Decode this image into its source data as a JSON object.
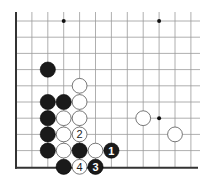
{
  "diagram": {
    "type": "go-board-fragment",
    "grid": {
      "cols": 12,
      "rows": 10,
      "origin_x": 16,
      "origin_y": 21,
      "spacing_x": 15.9,
      "spacing_y": 16.2,
      "left_edge": true,
      "bottom_edge": true,
      "line_color": "#9a9a9a",
      "edge_color": "#333333"
    },
    "star_points": [
      {
        "col": 3,
        "row": 0
      },
      {
        "col": 9,
        "row": 0
      },
      {
        "col": 9,
        "row": 6
      }
    ],
    "stones": [
      {
        "color": "black",
        "col": 2,
        "row": 3,
        "label": ""
      },
      {
        "color": "white",
        "col": 4,
        "row": 4,
        "label": ""
      },
      {
        "color": "black",
        "col": 2,
        "row": 5,
        "label": ""
      },
      {
        "color": "black",
        "col": 3,
        "row": 5,
        "label": ""
      },
      {
        "color": "white",
        "col": 4,
        "row": 5,
        "label": ""
      },
      {
        "color": "black",
        "col": 2,
        "row": 6,
        "label": ""
      },
      {
        "color": "white",
        "col": 3,
        "row": 6,
        "label": ""
      },
      {
        "color": "white",
        "col": 4,
        "row": 6,
        "label": ""
      },
      {
        "color": "black",
        "col": 2,
        "row": 7,
        "label": ""
      },
      {
        "color": "white",
        "col": 3,
        "row": 7,
        "label": ""
      },
      {
        "color": "white",
        "col": 4,
        "row": 7,
        "label": "2"
      },
      {
        "color": "black",
        "col": 2,
        "row": 8,
        "label": ""
      },
      {
        "color": "white",
        "col": 3,
        "row": 8,
        "label": ""
      },
      {
        "color": "black",
        "col": 4,
        "row": 8,
        "label": ""
      },
      {
        "color": "white",
        "col": 5,
        "row": 8,
        "label": ""
      },
      {
        "color": "black",
        "col": 6,
        "row": 8,
        "label": "1"
      },
      {
        "color": "black",
        "col": 3,
        "row": 9,
        "label": ""
      },
      {
        "color": "white",
        "col": 4,
        "row": 9,
        "label": "4"
      },
      {
        "color": "black",
        "col": 5,
        "row": 9,
        "label": "3"
      },
      {
        "color": "white",
        "col": 8,
        "row": 6,
        "label": ""
      },
      {
        "color": "white",
        "col": 10,
        "row": 7,
        "label": ""
      }
    ]
  }
}
